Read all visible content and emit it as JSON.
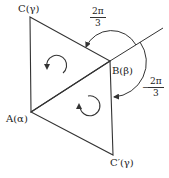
{
  "diagram": {
    "vertices": {
      "C": {
        "label": "C(γ)",
        "x": 30,
        "y": 17
      },
      "B": {
        "label": "B(β)",
        "x": 110,
        "y": 61
      },
      "A": {
        "label": "A(α)",
        "x": 31,
        "y": 112
      },
      "C_prime": {
        "label": "C′(γ)",
        "x": 113,
        "y": 155
      }
    },
    "angles": {
      "upper": {
        "numerator": "2π",
        "denominator": "3"
      },
      "lower": {
        "sign": "−",
        "numerator": "2π",
        "denominator": "3"
      }
    },
    "rotation_symbols": [
      {
        "triangle": "ABC",
        "direction": "clockwise"
      },
      {
        "triangle": "ABC′",
        "direction": "counterclockwise"
      }
    ],
    "stroke_color": "#333333"
  }
}
